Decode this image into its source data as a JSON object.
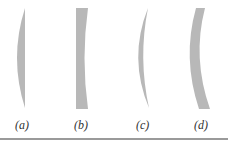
{
  "figure": {
    "lens_color": "#b8b8b8",
    "rule_color": "#9a9a9a",
    "label_color": "#333333",
    "lenses": [
      {
        "id": "a",
        "label": "(a)",
        "type": "plano-convex",
        "label_x": 15
      },
      {
        "id": "b",
        "label": "(b)",
        "type": "plano-concave",
        "label_x": 74
      },
      {
        "id": "c",
        "label": "(c)",
        "type": "converging-meniscus",
        "label_x": 136
      },
      {
        "id": "d",
        "label": "(d)",
        "type": "diverging-meniscus",
        "label_x": 194
      }
    ]
  }
}
